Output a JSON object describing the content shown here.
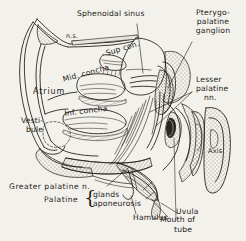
{
  "figure": {
    "background_color": "#f3f1ec",
    "ink_color": "#1d1a16"
  },
  "labels": {
    "sphenoidal_sinus": "Sphenoidal sinus",
    "pterygopalatine_ganglion_line1": "Pterygo-",
    "pterygopalatine_ganglion_line2": "palatine",
    "pterygopalatine_ganglion_line3": "ganglion",
    "lesser_palatine_line1": "Lesser",
    "lesser_palatine_line2": "palatine",
    "lesser_palatine_line3": "nn.",
    "sup_concha": "Sup con.",
    "mid_concha": "Mid. concha",
    "inf_concha": "Inf. concha",
    "atrium": "Atrium",
    "vestibule_line1": "Vesti-",
    "vestibule_line2": "bule",
    "axis": "Axis",
    "uvula": "Uvula",
    "mouth_of_tube_line1": "Mouth of",
    "mouth_of_tube_line2": "tube",
    "greater_palatine_n": "Greater palatine n.",
    "palatine": "Palatine",
    "palatine_glands": "glands",
    "palatine_aponeurosis": "aponeurosis",
    "hamulus": "Hamulus",
    "cribriform_mark": "n.s."
  },
  "icons": {
    "brace": "{"
  }
}
